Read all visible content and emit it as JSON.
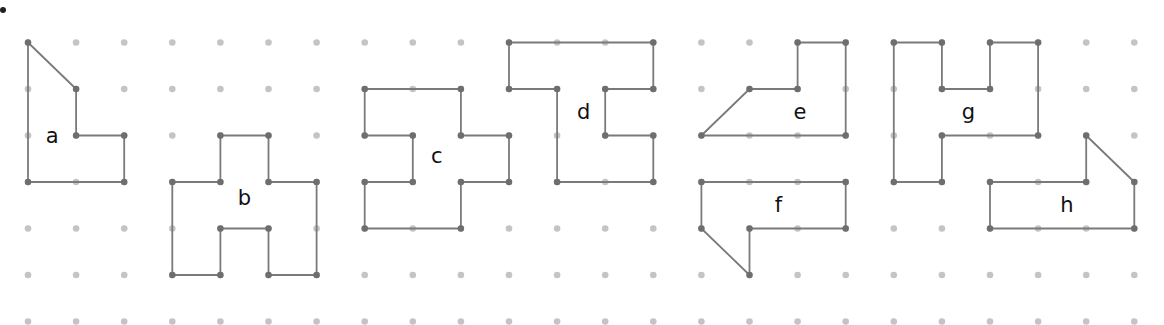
{
  "diagram": {
    "title": "",
    "colors": {
      "background": "#ffffff",
      "grid_dot": "#c4c4c4",
      "vertex_dot": "#6e6e6e",
      "edge": "#7a7a7a",
      "label": "#111111",
      "bullet": "#222222"
    },
    "grid": {
      "columns": 24,
      "rows": 8,
      "x0": 28,
      "dx": 48.1,
      "y0": -4,
      "dy": 46.5
    },
    "shapes": [
      {
        "label": "a",
        "label_pos": [
          1,
          3
        ],
        "label_offset": [
          -24,
          0
        ],
        "vertices": [
          [
            0,
            1
          ],
          [
            1,
            2
          ],
          [
            1,
            3
          ],
          [
            2,
            3
          ],
          [
            2,
            4
          ],
          [
            0,
            4
          ]
        ]
      },
      {
        "label": "b",
        "label_pos": [
          4.5,
          4.35
        ],
        "label_offset": [
          0,
          0
        ],
        "vertices": [
          [
            4,
            3
          ],
          [
            5,
            3
          ],
          [
            5,
            4
          ],
          [
            6,
            4
          ],
          [
            6,
            6
          ],
          [
            5,
            6
          ],
          [
            5,
            5
          ],
          [
            4,
            5
          ],
          [
            4,
            6
          ],
          [
            3,
            6
          ],
          [
            3,
            4
          ],
          [
            4,
            4
          ]
        ]
      },
      {
        "label": "c",
        "label_pos": [
          8.5,
          3.45
        ],
        "label_offset": [
          0,
          0
        ],
        "vertices": [
          [
            7,
            2
          ],
          [
            9,
            2
          ],
          [
            9,
            3
          ],
          [
            10,
            3
          ],
          [
            10,
            4
          ],
          [
            9,
            4
          ],
          [
            9,
            5
          ],
          [
            7,
            5
          ],
          [
            7,
            4
          ],
          [
            8,
            4
          ],
          [
            8,
            3
          ],
          [
            7,
            3
          ]
        ]
      },
      {
        "label": "d",
        "label_pos": [
          11.55,
          2.5
        ],
        "label_offset": [
          0,
          0
        ],
        "vertices": [
          [
            10,
            1
          ],
          [
            13,
            1
          ],
          [
            13,
            2
          ],
          [
            12,
            2
          ],
          [
            12,
            3
          ],
          [
            13,
            3
          ],
          [
            13,
            4
          ],
          [
            11,
            4
          ],
          [
            11,
            2
          ],
          [
            10,
            2
          ]
        ]
      },
      {
        "label": "e",
        "label_pos": [
          16.05,
          2.5
        ],
        "label_offset": [
          0,
          0
        ],
        "vertices": [
          [
            16,
            1
          ],
          [
            17,
            1
          ],
          [
            17,
            3
          ],
          [
            14,
            3
          ],
          [
            15,
            2
          ],
          [
            16,
            2
          ]
        ]
      },
      {
        "label": "f",
        "label_pos": [
          15.6,
          4.5
        ],
        "label_offset": [
          0,
          0
        ],
        "vertices": [
          [
            14,
            4
          ],
          [
            17,
            4
          ],
          [
            17,
            5
          ],
          [
            15,
            5
          ],
          [
            15,
            6
          ],
          [
            14,
            5
          ]
        ]
      },
      {
        "label": "g",
        "label_pos": [
          19.55,
          2.5
        ],
        "label_offset": [
          0,
          0
        ],
        "vertices": [
          [
            18,
            1
          ],
          [
            19,
            1
          ],
          [
            19,
            2
          ],
          [
            20,
            2
          ],
          [
            20,
            1
          ],
          [
            21,
            1
          ],
          [
            21,
            3
          ],
          [
            19,
            3
          ],
          [
            19,
            4
          ],
          [
            18,
            4
          ]
        ]
      },
      {
        "label": "h",
        "label_pos": [
          21.6,
          4.5
        ],
        "label_offset": [
          0,
          0
        ],
        "vertices": [
          [
            22,
            3
          ],
          [
            23,
            4
          ],
          [
            23,
            5
          ],
          [
            20,
            5
          ],
          [
            20,
            4
          ],
          [
            22,
            4
          ]
        ]
      }
    ]
  }
}
